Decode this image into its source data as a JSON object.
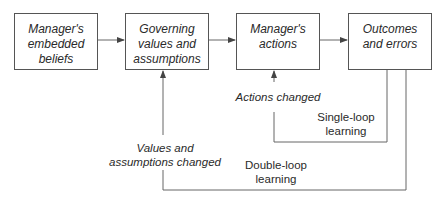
{
  "boxes": [
    {
      "id": "embedded-beliefs",
      "label": "Manager's\nembedded\nbeliefs"
    },
    {
      "id": "governing-values",
      "label": "Governing\nvalues and\nassumptions"
    },
    {
      "id": "actions",
      "label": "Manager's\nactions"
    },
    {
      "id": "outcomes",
      "label": "Outcomes\nand errors"
    }
  ],
  "labels": {
    "actions_changed": "Actions changed",
    "single_loop": "Single-loop\nlearning",
    "values_changed": "Values and\nassumptions changed",
    "double_loop": "Double-loop\nlearning"
  },
  "colors": {
    "line": "#555555",
    "text": "#2a2a2a"
  }
}
